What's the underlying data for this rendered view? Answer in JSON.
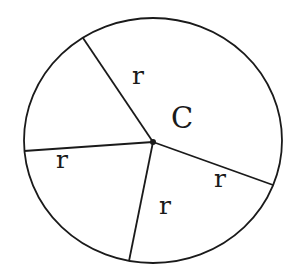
{
  "diagram": {
    "center_label": "C",
    "radius_labels": [
      "r",
      "r",
      "r",
      "r"
    ],
    "stroke_color": "#1a1a1a",
    "background": "#ffffff"
  }
}
